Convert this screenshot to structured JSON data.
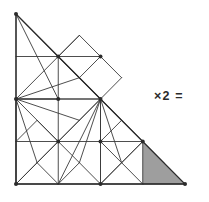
{
  "figure": {
    "shape_type": "right-isosceles-triangle",
    "canvas": {
      "width": 209,
      "height": 202
    },
    "stroke_color": "#3a3a3a",
    "outline_color": "#2b2b2b",
    "shade_color": "#9e9e9e",
    "background_color": "#ffffff",
    "stroke_width": 0.9,
    "outline_width": 1.3,
    "vertices": {
      "apex_top_left": [
        16,
        14
      ],
      "corner_bottom_left": [
        16,
        184
      ],
      "corner_bottom_right": [
        185,
        184
      ]
    },
    "grid": {
      "divisions": 4,
      "x_lines": [
        16,
        58.25,
        100.5,
        142.75,
        185
      ],
      "y_lines": [
        14,
        56.5,
        99,
        141.5,
        184
      ]
    },
    "node_markers": [
      [
        16,
        14
      ],
      [
        58.25,
        56.5
      ],
      [
        16,
        99
      ],
      [
        100.5,
        99
      ],
      [
        58.25,
        141.5
      ],
      [
        100.5,
        141.5
      ],
      [
        142.75,
        141.5
      ],
      [
        16,
        184
      ],
      [
        100.5,
        184
      ],
      [
        185,
        184
      ],
      [
        100.5,
        56.5
      ],
      [
        58.25,
        99
      ]
    ],
    "shaded_cell": {
      "label": "unit-triangle",
      "points": "142.75,141.5 185,184 142.75,184"
    },
    "outline_points": "16,14 185,184 16,184",
    "segments": [
      {
        "name": "grid-h-1",
        "x1": 16,
        "y1": 56.5,
        "x2": 58.25,
        "y2": 56.5
      },
      {
        "name": "grid-h-2",
        "x1": 16,
        "y1": 99,
        "x2": 100.5,
        "y2": 99
      },
      {
        "name": "grid-h-3",
        "x1": 16,
        "y1": 141.5,
        "x2": 142.75,
        "y2": 141.5
      },
      {
        "name": "grid-v-1",
        "x1": 58.25,
        "y1": 56.5,
        "x2": 58.25,
        "y2": 184
      },
      {
        "name": "grid-v-2",
        "x1": 100.5,
        "y1": 99,
        "x2": 100.5,
        "y2": 184
      },
      {
        "name": "grid-v-3",
        "x1": 142.75,
        "y1": 141.5,
        "x2": 142.75,
        "y2": 184
      },
      {
        "name": "left-edge",
        "x1": 16,
        "y1": 14,
        "x2": 16,
        "y2": 184
      },
      {
        "name": "diag-a1",
        "x1": 16,
        "y1": 14,
        "x2": 58.25,
        "y2": 56.5
      },
      {
        "name": "diag-a2",
        "x1": 16,
        "y1": 14,
        "x2": 100.5,
        "y2": 99
      },
      {
        "name": "diag-a3",
        "x1": 16,
        "y1": 14,
        "x2": 58.25,
        "y2": 99
      },
      {
        "name": "diag-a4",
        "x1": 16,
        "y1": 14,
        "x2": 79.4,
        "y2": 77.7
      },
      {
        "name": "cell-r1c1-d",
        "x1": 58.25,
        "y1": 56.5,
        "x2": 79.4,
        "y2": 35.3
      },
      {
        "name": "cell-r1c1-e",
        "x1": 58.25,
        "y1": 56.5,
        "x2": 100.5,
        "y2": 56.5
      },
      {
        "name": "cell-r1c1-f",
        "x1": 58.25,
        "y1": 56.5,
        "x2": 79.4,
        "y2": 77.7
      },
      {
        "name": "cell-r1c1-g",
        "x1": 100.5,
        "y1": 56.5,
        "x2": 79.4,
        "y2": 77.7
      },
      {
        "name": "cell-r1c1-h",
        "x1": 79.4,
        "y1": 77.7,
        "x2": 100.5,
        "y2": 99
      },
      {
        "name": "cell-r1c1-i",
        "x1": 58.25,
        "y1": 56.5,
        "x2": 100.5,
        "y2": 99
      },
      {
        "name": "cell-r1c1-j",
        "x1": 79.4,
        "y1": 35.3,
        "x2": 100.5,
        "y2": 56.5
      },
      {
        "name": "mid-k1",
        "x1": 16,
        "y1": 99,
        "x2": 58.25,
        "y2": 56.5
      },
      {
        "name": "mid-k2",
        "x1": 16,
        "y1": 99,
        "x2": 79.4,
        "y2": 77.7
      },
      {
        "name": "mid-k3",
        "x1": 16,
        "y1": 99,
        "x2": 100.5,
        "y2": 99
      },
      {
        "name": "mid-k4",
        "x1": 16,
        "y1": 99,
        "x2": 79.4,
        "y2": 120.3
      },
      {
        "name": "mid-k5",
        "x1": 16,
        "y1": 99,
        "x2": 58.25,
        "y2": 141.5
      },
      {
        "name": "mid-k6",
        "x1": 16,
        "y1": 99,
        "x2": 37.1,
        "y2": 162.7
      },
      {
        "name": "mid-k7",
        "x1": 16,
        "y1": 99,
        "x2": 16,
        "y2": 184
      },
      {
        "name": "mid-k8",
        "x1": 16,
        "y1": 99,
        "x2": 58.25,
        "y2": 99
      },
      {
        "name": "ctr-m1",
        "x1": 100.5,
        "y1": 99,
        "x2": 58.25,
        "y2": 141.5
      },
      {
        "name": "ctr-m2",
        "x1": 100.5,
        "y1": 99,
        "x2": 79.4,
        "y2": 120.3
      },
      {
        "name": "ctr-m3",
        "x1": 100.5,
        "y1": 99,
        "x2": 100.5,
        "y2": 141.5
      },
      {
        "name": "ctr-m4",
        "x1": 100.5,
        "y1": 99,
        "x2": 121.6,
        "y2": 120.3
      },
      {
        "name": "ctr-m5",
        "x1": 100.5,
        "y1": 99,
        "x2": 142.75,
        "y2": 141.5
      },
      {
        "name": "ctr-m6",
        "x1": 100.5,
        "y1": 99,
        "x2": 121.6,
        "y2": 162.7
      },
      {
        "name": "ctr-m7",
        "x1": 100.5,
        "y1": 99,
        "x2": 100.5,
        "y2": 184
      },
      {
        "name": "ctr-m8",
        "x1": 100.5,
        "y1": 99,
        "x2": 79.4,
        "y2": 162.7
      },
      {
        "name": "ctr-m9",
        "x1": 100.5,
        "y1": 99,
        "x2": 58.25,
        "y2": 184
      },
      {
        "name": "low-n1",
        "x1": 58.25,
        "y1": 141.5,
        "x2": 79.4,
        "y2": 120.3
      },
      {
        "name": "low-n2",
        "x1": 58.25,
        "y1": 141.5,
        "x2": 37.1,
        "y2": 120.3
      },
      {
        "name": "low-n3",
        "x1": 16,
        "y1": 141.5,
        "x2": 37.1,
        "y2": 120.3
      },
      {
        "name": "low-n4",
        "x1": 58.25,
        "y1": 141.5,
        "x2": 37.1,
        "y2": 162.7
      },
      {
        "name": "low-n5",
        "x1": 16,
        "y1": 184,
        "x2": 37.1,
        "y2": 162.7
      },
      {
        "name": "low-n6",
        "x1": 58.25,
        "y1": 141.5,
        "x2": 79.4,
        "y2": 162.7
      },
      {
        "name": "low-n7",
        "x1": 100.5,
        "y1": 184,
        "x2": 79.4,
        "y2": 162.7
      },
      {
        "name": "low-n8",
        "x1": 16,
        "y1": 184,
        "x2": 58.25,
        "y2": 141.5
      },
      {
        "name": "low-n9",
        "x1": 58.25,
        "y1": 184,
        "x2": 79.4,
        "y2": 162.7
      },
      {
        "name": "low-n10",
        "x1": 58.25,
        "y1": 184,
        "x2": 37.1,
        "y2": 162.7
      },
      {
        "name": "low-p1",
        "x1": 100.5,
        "y1": 141.5,
        "x2": 121.6,
        "y2": 120.3
      },
      {
        "name": "low-p2",
        "x1": 100.5,
        "y1": 141.5,
        "x2": 121.6,
        "y2": 162.7
      },
      {
        "name": "low-p3",
        "x1": 142.75,
        "y1": 141.5,
        "x2": 121.6,
        "y2": 162.7
      },
      {
        "name": "low-p4",
        "x1": 142.75,
        "y1": 141.5,
        "x2": 121.6,
        "y2": 120.3
      },
      {
        "name": "low-p5",
        "x1": 100.5,
        "y1": 184,
        "x2": 121.6,
        "y2": 162.7
      },
      {
        "name": "low-p6",
        "x1": 142.75,
        "y1": 184,
        "x2": 121.6,
        "y2": 162.7
      },
      {
        "name": "low-p7",
        "x1": 100.5,
        "y1": 184,
        "x2": 142.75,
        "y2": 141.5
      },
      {
        "name": "hyp-q1",
        "x1": 58.25,
        "y1": 56.5,
        "x2": 79.4,
        "y2": 35.3
      },
      {
        "name": "hyp-q2",
        "x1": 100.5,
        "y1": 56.5,
        "x2": 121.6,
        "y2": 77.7
      },
      {
        "name": "hyp-q3",
        "x1": 100.5,
        "y1": 99,
        "x2": 121.6,
        "y2": 77.7
      },
      {
        "name": "hyp-q4",
        "x1": 142.75,
        "y1": 141.5,
        "x2": 163.9,
        "y2": 162.7
      },
      {
        "name": "bottom-edge",
        "x1": 16,
        "y1": 184,
        "x2": 185,
        "y2": 184
      }
    ]
  },
  "annotation": {
    "multiplier_label": "×2 ="
  }
}
